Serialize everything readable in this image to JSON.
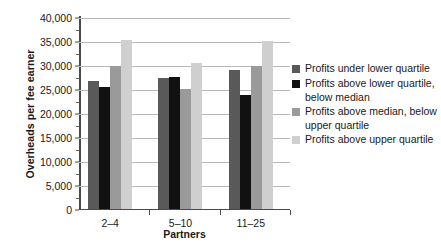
{
  "chart_data": {
    "type": "bar",
    "title": "",
    "xlabel": "Partners",
    "ylabel": "Overheads per fee earner",
    "categories": [
      "2–4",
      "5–10",
      "11–25"
    ],
    "ylim": [
      0,
      40000
    ],
    "ytick_labels": [
      "0",
      "5,000",
      "10,000",
      "15,000",
      "20,000",
      "25,000",
      "30,000",
      "35,000",
      "40,000"
    ],
    "ytick_values": [
      0,
      5000,
      10000,
      15000,
      20000,
      25000,
      30000,
      35000,
      40000
    ],
    "grid": "horizontal",
    "legend_position": "right",
    "series": [
      {
        "name": "Profits under lower quartile",
        "name_line2": "",
        "color": "#595959",
        "values": [
          26600,
          27200,
          28800
        ]
      },
      {
        "name": "Profits above lower quartile,",
        "name_line2": "below median",
        "color": "#111111",
        "values": [
          25400,
          27300,
          23600
        ]
      },
      {
        "name": "Profits above median, below",
        "name_line2": "upper quartile",
        "color": "#9a9a9a",
        "values": [
          29700,
          25000,
          29700
        ]
      },
      {
        "name": "Profits above upper quartile",
        "name_line2": "",
        "color": "#cfcfcf",
        "values": [
          35200,
          30400,
          35000
        ]
      }
    ]
  }
}
